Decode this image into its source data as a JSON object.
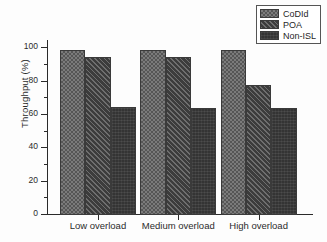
{
  "chart_data": {
    "type": "bar",
    "title": "",
    "xlabel": "",
    "ylabel": "Throughput (%)",
    "categories": [
      "Low  overload",
      "Medium  overload",
      "High  overload"
    ],
    "series": [
      {
        "name": "CoDId",
        "values": [
          99,
          99,
          99
        ]
      },
      {
        "name": "POA",
        "values": [
          95,
          95,
          78
        ]
      },
      {
        "name": "Non-ISL",
        "values": [
          65,
          64,
          64
        ]
      }
    ],
    "ylim": [
      0,
      105
    ],
    "yticks": [
      0,
      20,
      40,
      60,
      80,
      100
    ],
    "ytick_labels": [
      "0",
      "20",
      "40",
      "60",
      "80",
      "100"
    ],
    "yminor_ticks": [
      10,
      30,
      50,
      70,
      90
    ],
    "grid": false,
    "legend_position": "top-right",
    "colors": {
      "codid": "#7b7b7b",
      "poa": "#4a4a4a",
      "non_isl": "#343434",
      "axis": "#2a2a2a",
      "text": "#2b2b2b",
      "background": "#fdfdfd"
    }
  },
  "legend": {
    "items": [
      {
        "label": "CoDId"
      },
      {
        "label": "POA"
      },
      {
        "label": "Non-ISL"
      }
    ]
  }
}
